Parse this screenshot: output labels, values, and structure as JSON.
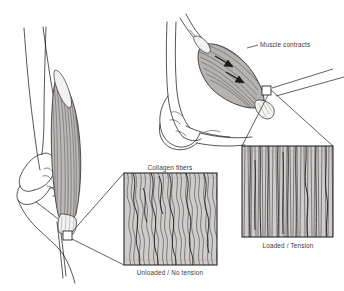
{
  "figure": {
    "type": "anatomical-line-diagram",
    "title_visible": false,
    "background_color": "#ffffff",
    "ink_color": "#2b2b2b",
    "text_color": "#3b3b3b",
    "fiber_fill_color": "#cfcccb",
    "muscle_shade_color": "#b9b5b3"
  },
  "labels": {
    "muscle_contracts": "Muscle contracts",
    "collagen_fibers": "Collagen fibers",
    "unloaded": "Unloaded / No tension",
    "loaded": "Loaded / Tension"
  },
  "panels": [
    {
      "name": "left-limb-relaxed",
      "description": "Knee joint with relaxed muscle and tendon, callout square on tendon",
      "callout_label": "unloaded"
    },
    {
      "name": "right-limb-contracted",
      "description": "Elbow/knee joint with bulging contracted muscle and two contraction arrows, callout square on tendon",
      "callout_label": "loaded"
    }
  ],
  "insets": [
    {
      "name": "unloaded-fiber-inset",
      "caption": "Unloaded / No tension",
      "header": "Collagen fibers",
      "fiber_pattern": "wavy-crimped",
      "fiber_count": 34
    },
    {
      "name": "loaded-fiber-inset",
      "caption": "Loaded / Tension",
      "fiber_pattern": "straightened-vertical",
      "fiber_count": 30
    }
  ],
  "arrows": {
    "contraction_arrow_count": 2,
    "direction": "inward-toward-muscle-belly"
  }
}
